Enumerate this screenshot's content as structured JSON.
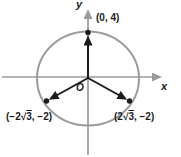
{
  "figure": {
    "colors": {
      "axis": "#9b9b9b",
      "circle": "#9b9b9b",
      "vector": "#1b1b1b",
      "text": "#1b1b1b",
      "background": "#ffffff"
    },
    "axes": {
      "x_label": "x",
      "y_label": "y",
      "origin_label": "O"
    },
    "points": {
      "top": {
        "label": "(0, 4)"
      },
      "left": {
        "open": "(−2",
        "radical": "√",
        "radicand": "3",
        "close": ", −2)"
      },
      "right": {
        "open": "(2",
        "radical": "√",
        "radicand": "3",
        "close": ", −2)"
      }
    }
  }
}
